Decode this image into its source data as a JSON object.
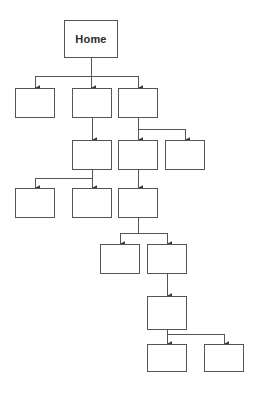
{
  "diagram": {
    "type": "tree-flowchart",
    "background_color": "#ffffff",
    "box_fill_color": "#ffffff",
    "box_border_color": "#555555",
    "connector_color": "#555555",
    "text_color": "#2b2b2b",
    "orientation": "top-down",
    "level_count": 8,
    "node_count": 15,
    "nodes": [
      {
        "id": "n1",
        "label": "Home",
        "level": 1,
        "x": 64,
        "y": 20,
        "w": 54,
        "h": 38
      },
      {
        "id": "n2",
        "label": "",
        "level": 2,
        "x": 15,
        "y": 88,
        "w": 40,
        "h": 30
      },
      {
        "id": "n3",
        "label": "",
        "level": 2,
        "x": 72,
        "y": 88,
        "w": 40,
        "h": 30
      },
      {
        "id": "n4",
        "label": "",
        "level": 2,
        "x": 118,
        "y": 88,
        "w": 40,
        "h": 30
      },
      {
        "id": "n5",
        "label": "",
        "level": 3,
        "x": 72,
        "y": 140,
        "w": 40,
        "h": 30
      },
      {
        "id": "n6",
        "label": "",
        "level": 3,
        "x": 118,
        "y": 140,
        "w": 40,
        "h": 30
      },
      {
        "id": "n7",
        "label": "",
        "level": 3,
        "x": 165,
        "y": 140,
        "w": 40,
        "h": 30
      },
      {
        "id": "n8",
        "label": "",
        "level": 4,
        "x": 15,
        "y": 188,
        "w": 40,
        "h": 30
      },
      {
        "id": "n9",
        "label": "",
        "level": 4,
        "x": 72,
        "y": 188,
        "w": 40,
        "h": 30
      },
      {
        "id": "n10",
        "label": "",
        "level": 4,
        "x": 118,
        "y": 188,
        "w": 40,
        "h": 30
      },
      {
        "id": "n11",
        "label": "",
        "level": 5,
        "x": 100,
        "y": 244,
        "w": 40,
        "h": 30
      },
      {
        "id": "n12",
        "label": "",
        "level": 5,
        "x": 147,
        "y": 244,
        "w": 40,
        "h": 30
      },
      {
        "id": "n13",
        "label": "",
        "level": 6,
        "x": 147,
        "y": 296,
        "w": 40,
        "h": 34
      },
      {
        "id": "n14",
        "label": "",
        "level": 7,
        "x": 147,
        "y": 344,
        "w": 40,
        "h": 28
      },
      {
        "id": "n15",
        "label": "",
        "level": 7,
        "x": 204,
        "y": 344,
        "w": 40,
        "h": 28
      }
    ],
    "edges": [
      {
        "from": "n1",
        "to": "n2",
        "style": "elbow-left"
      },
      {
        "from": "n1",
        "to": "n3",
        "style": "straight"
      },
      {
        "from": "n1",
        "to": "n4",
        "style": "elbow-right"
      },
      {
        "from": "n3",
        "to": "n5",
        "style": "straight"
      },
      {
        "from": "n4",
        "to": "n6",
        "style": "straight"
      },
      {
        "from": "n4",
        "to": "n7",
        "style": "elbow-right"
      },
      {
        "from": "n5",
        "to": "n8",
        "style": "elbow-left"
      },
      {
        "from": "n5",
        "to": "n9",
        "style": "straight"
      },
      {
        "from": "n6",
        "to": "n10",
        "style": "straight"
      },
      {
        "from": "n10",
        "to": "n11",
        "style": "elbow-left"
      },
      {
        "from": "n10",
        "to": "n12",
        "style": "elbow-right"
      },
      {
        "from": "n12",
        "to": "n13",
        "style": "straight"
      },
      {
        "from": "n13",
        "to": "n14",
        "style": "straight"
      },
      {
        "from": "n13",
        "to": "n15",
        "style": "elbow-right"
      }
    ]
  }
}
